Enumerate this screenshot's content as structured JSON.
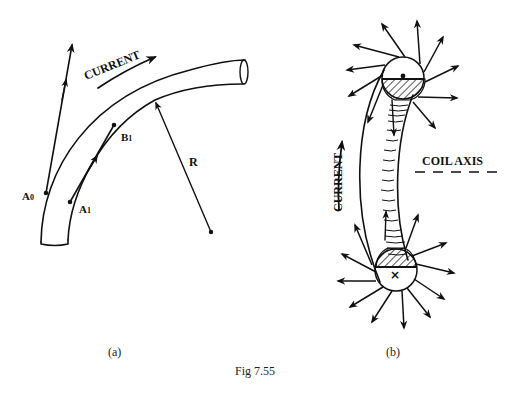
{
  "figure": {
    "caption": "Fig 7.55",
    "panel_a": {
      "label": "(a)",
      "current_label": "CURRENT",
      "points": {
        "a0": "A",
        "a0_sub": "0",
        "a1": "A",
        "a1_sub": "1",
        "b1": "B",
        "b1_sub": "1"
      },
      "radius_label": "R"
    },
    "panel_b": {
      "label": "(b)",
      "current_label": "CURRENT",
      "axis_label": "COIL AXIS",
      "top_symbol": "dot (current out of page)",
      "bottom_symbol": "×"
    }
  },
  "colors": {
    "ink": "#111111",
    "background": "#ffffff"
  }
}
